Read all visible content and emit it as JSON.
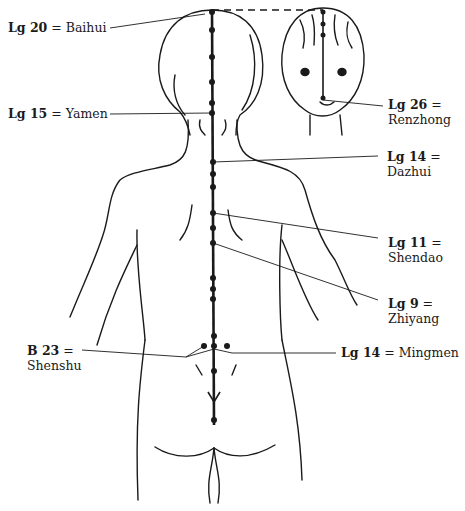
{
  "figure": {
    "points": [
      {
        "id": "lg20",
        "code": "Lg 20",
        "eq": "=",
        "name": "Baihui"
      },
      {
        "id": "lg15",
        "code": "Lg 15",
        "eq": "=",
        "name": "Yamen"
      },
      {
        "id": "lg26",
        "code": "Lg 26",
        "eq": "=",
        "name": "Renzhong"
      },
      {
        "id": "lg14a",
        "code": "Lg 14",
        "eq": "=",
        "name": "Dazhui"
      },
      {
        "id": "lg11",
        "code": "Lg 11",
        "eq": "=",
        "name": "Shendao"
      },
      {
        "id": "lg9",
        "code": "Lg 9",
        "eq": "=",
        "name": "Zhiyang"
      },
      {
        "id": "b23",
        "code": "B 23",
        "eq": "=",
        "name": "Shenshu"
      },
      {
        "id": "lg14b",
        "code": "Lg 14",
        "eq": "=",
        "name": "Mingmen"
      }
    ],
    "colors": {
      "ink": "#1a1a1a",
      "background": "#ffffff"
    }
  }
}
